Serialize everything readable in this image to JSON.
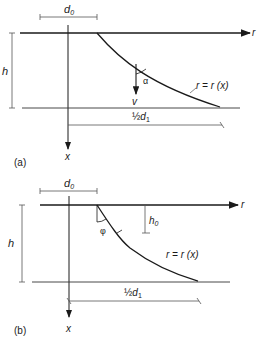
{
  "figure_a": {
    "caption": "(a)",
    "d0": "d",
    "d0_sub": "0",
    "h": "h",
    "r_axis": "r",
    "x_axis": "x",
    "alpha": "α",
    "v": "v",
    "curve_label": "r = r (x)",
    "half_d1_frac": "½",
    "half_d1": "d",
    "half_d1_sub": "1"
  },
  "figure_b": {
    "caption": "(b)",
    "d0": "d",
    "d0_sub": "0",
    "h": "h",
    "h0": "h",
    "h0_sub": "0",
    "r_axis": "r",
    "x_axis": "x",
    "phi": "φ",
    "curve_label": "r = r (x)",
    "half_d1_frac": "½",
    "half_d1": "d",
    "half_d1_sub": "1"
  },
  "colors": {
    "ink": "#1a1a1a",
    "thin": "#555555"
  }
}
